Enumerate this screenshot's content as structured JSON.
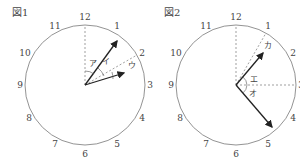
{
  "figures": [
    {
      "label": "図1",
      "numbers": [
        "12",
        "1",
        "2",
        "3",
        "4",
        "5",
        "6",
        "7",
        "8",
        "9",
        "10",
        "11"
      ],
      "angle_labels": {
        "a": "ア",
        "b": "イ",
        "c": "ウ"
      },
      "hands": {
        "long_to": "1",
        "short_to": "between 2 and 3"
      }
    },
    {
      "label": "図2",
      "numbers": [
        "12",
        "1",
        "2",
        "3",
        "4",
        "5",
        "6",
        "7",
        "8",
        "9",
        "10",
        "11"
      ],
      "angle_labels": {
        "a": "エ",
        "b": "オ",
        "c": "カ"
      },
      "hands": {
        "long_to": "between 4 and 5",
        "short_to": "between 1 and 2"
      }
    }
  ],
  "colors": {
    "line": "#555555",
    "hand": "#222222",
    "dashed": "#777777"
  }
}
